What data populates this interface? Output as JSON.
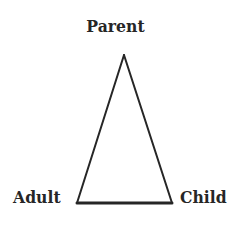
{
  "diagram": {
    "background_color": "#ffffff",
    "stroke_color": "#262626",
    "text_color": "#262626",
    "nodes": [
      {
        "id": "parent",
        "label": "Parent",
        "position": "top",
        "x": 124,
        "y": 55
      },
      {
        "id": "adult",
        "label": "Adult",
        "position": "bottom-left",
        "x": 77,
        "y": 203
      },
      {
        "id": "child",
        "label": "Child",
        "position": "bottom-right",
        "x": 172,
        "y": 203
      }
    ],
    "shape": {
      "kind": "triangle",
      "apex": {
        "x": 124,
        "y": 55
      },
      "bottom_left": {
        "x": 77,
        "y": 203
      },
      "bottom_right": {
        "x": 172,
        "y": 203
      },
      "side_stroke_width": 2,
      "base_stroke_width": 3
    }
  }
}
